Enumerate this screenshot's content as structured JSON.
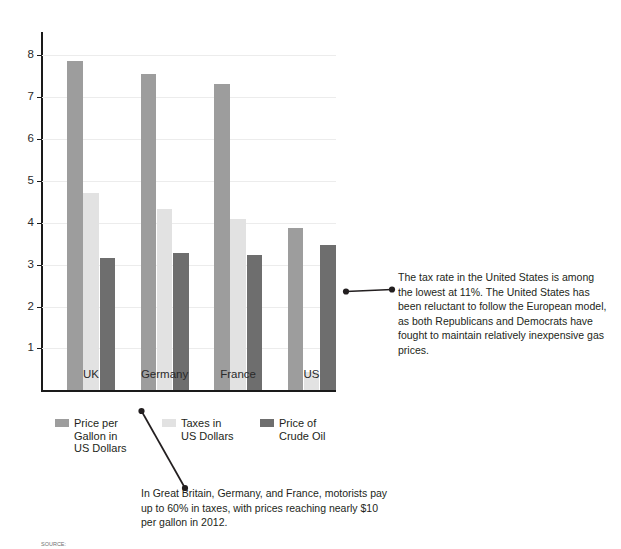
{
  "chart_data": {
    "type": "bar",
    "title": "",
    "xlabel": "",
    "ylabel": "",
    "categories": [
      "UK",
      "Germany",
      "France",
      "US"
    ],
    "series": [
      {
        "name": "Price per Gallon in US Dollars",
        "color": "#9d9d9d",
        "values": [
          7.85,
          7.56,
          7.32,
          3.88
        ]
      },
      {
        "name": "Taxes in US Dollars",
        "color": "#e2e2e2",
        "values": [
          4.72,
          4.32,
          4.1,
          0.43
        ]
      },
      {
        "name": "Price of Crude Oil",
        "color": "#6e6e6e",
        "values": [
          3.15,
          3.28,
          3.24,
          3.46
        ]
      }
    ],
    "ylim": [
      0,
      8.55
    ],
    "yticks": [
      1,
      2,
      3,
      4,
      5,
      6,
      7,
      8
    ],
    "ytick_labels": [
      "1",
      "2",
      "3",
      "4",
      "5",
      "6",
      "7",
      "8"
    ],
    "grid": true,
    "legend_position": "below-axis"
  },
  "legend": {
    "items": [
      {
        "label": "Price per\nGallon in\nUS Dollars",
        "color": "#9d9d9d"
      },
      {
        "label": "Taxes in\nUS Dollars",
        "color": "#e2e2e2"
      },
      {
        "label": "Price of\nCrude Oil",
        "color": "#6e6e6e"
      }
    ]
  },
  "annotations": {
    "us_tax_note": "The tax rate in the United States is among the lowest at 11%. The United States has been reluctant to follow the European model, as both Republicans and Democrats have fought to maintain relatively inexpensive gas prices.",
    "europe_tax_note": "In Great Britain, Germany, and France, motorists pay up to 60% in taxes, with prices reaching nearly $10 per gallon in 2012."
  },
  "footer": {
    "source": "SOURCE:"
  }
}
